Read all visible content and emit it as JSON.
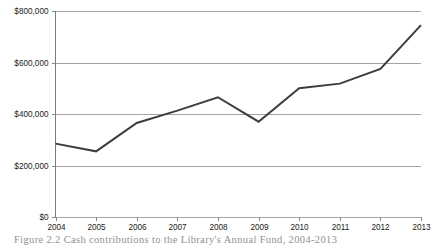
{
  "figure": {
    "caption": "Figure 2.2   Cash contributions to the Library's Annual Fund, 2004-2013"
  },
  "colors": {
    "line": "#3d3d3d",
    "gridline": "#9a9a9a",
    "axis": "#7d7d7d",
    "background": "#ffffff",
    "text": "#1a1a1a"
  },
  "chart_data": {
    "type": "line",
    "title": "",
    "xlabel": "",
    "ylabel": "",
    "categories": [
      "2004",
      "2005",
      "2006",
      "2007",
      "2008",
      "2009",
      "2010",
      "2011",
      "2012",
      "2013"
    ],
    "values": [
      285000,
      255000,
      365000,
      413000,
      465000,
      370000,
      500000,
      518000,
      575000,
      745000
    ],
    "ylim": [
      0,
      800000
    ],
    "yticks": [
      0,
      200000,
      400000,
      600000,
      800000
    ],
    "ytick_labels": [
      "$0",
      "$200,000",
      "$400,000",
      "$600,000",
      "$800,000"
    ],
    "xtick_labels": [
      "2004",
      "2005",
      "2006",
      "2007",
      "2008",
      "2009",
      "2010",
      "2011",
      "2012",
      "2013"
    ],
    "grid": true,
    "legend": false,
    "legend_position": "none",
    "series": [
      {
        "name": "Cash contributions",
        "values": [
          285000,
          255000,
          365000,
          413000,
          465000,
          370000,
          500000,
          518000,
          575000,
          745000
        ]
      }
    ]
  }
}
